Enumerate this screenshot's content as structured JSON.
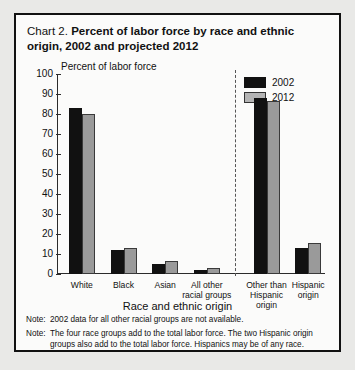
{
  "title": {
    "prefix": "Chart 2.",
    "main": "Percent of labor force by race and ethnic origin, 2002 and projected 2012"
  },
  "legend": {
    "position": "top-right",
    "entries": [
      {
        "label": "2002",
        "color": "#111111"
      },
      {
        "label": "2012",
        "color": "#9a9a9a"
      }
    ]
  },
  "axis": {
    "y_caption": "Percent of labor force",
    "x_title": "Race and ethnic origin",
    "y_ticks": [
      "100",
      "90",
      "80",
      "70",
      "60",
      "50",
      "40",
      "30",
      "20",
      "10",
      "0"
    ]
  },
  "notes": [
    {
      "tag": "Note:",
      "text": "2002 data for all other racial groups are not available."
    },
    {
      "tag": "Note:",
      "text": "The four race groups add to the total labor force. The two Hispanic origin groups also add to the total labor force. Hispanics may be of any race."
    }
  ],
  "chart_data": {
    "type": "bar",
    "title": "Chart 2. Percent of labor force by race and ethnic origin, 2002 and projected 2012",
    "xlabel": "Race and ethnic origin",
    "ylabel": "Percent of labor force",
    "ylim": [
      0,
      100
    ],
    "ytick_step": 10,
    "grid": false,
    "legend_position": "top-right",
    "categories": [
      "White",
      "Black",
      "Asian",
      "All other racial groups",
      "Other than Hispanic origin",
      "Hispanic origin"
    ],
    "series": [
      {
        "name": "2002",
        "color": "#111111",
        "values": [
          83,
          12,
          5,
          2,
          88,
          13
        ]
      },
      {
        "name": "2012",
        "color": "#9a9a9a",
        "values": [
          80,
          13,
          6.5,
          3,
          86.5,
          15.5
        ]
      }
    ],
    "annotations": [
      "Dashed vertical divider separates the four race groups from the two Hispanic origin groups"
    ]
  }
}
